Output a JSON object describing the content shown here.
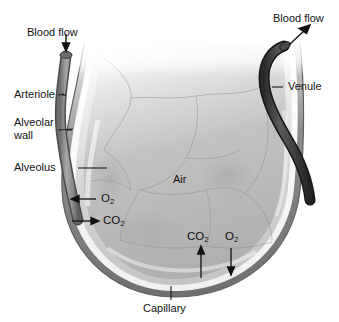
{
  "figure": {
    "background_color": "#ffffff"
  },
  "labels": {
    "blood_flow_in": "Blood flow",
    "blood_flow_out": "Blood flow",
    "arteriole": "Arteriole",
    "alveolar_wall": "Alveolar\nwall",
    "alveolar_wall_line1": "Alveolar",
    "alveolar_wall_line2": "wall",
    "alveolus": "Alveolus",
    "venule": "Venule",
    "air": "Air",
    "capillary": "Capillary"
  },
  "gases": {
    "left_oxygen": "O",
    "left_oxygen_sub": "2",
    "left_carbon_dioxide": "CO",
    "left_carbon_dioxide_sub": "2",
    "right_carbon_dioxide": "CO",
    "right_carbon_dioxide_sub": "2",
    "right_oxygen": "O",
    "right_oxygen_sub": "2"
  },
  "arrow_directions": {
    "blood_flow_in": "down",
    "blood_flow_out": "up-right",
    "left_oxygen": "left",
    "left_carbon_dioxide": "right",
    "right_carbon_dioxide": "up",
    "right_oxygen": "down"
  },
  "colors": {
    "arteriole": "#8c8c8c",
    "venule": "#3a3a3a",
    "alveolar_wall_outer": "#7d7d7d",
    "alveolar_wall_inner": "#f2f2f2",
    "alveolus_interior": "#b9b9b9",
    "text": "#141414",
    "leader_line": "#1a1a1a"
  }
}
